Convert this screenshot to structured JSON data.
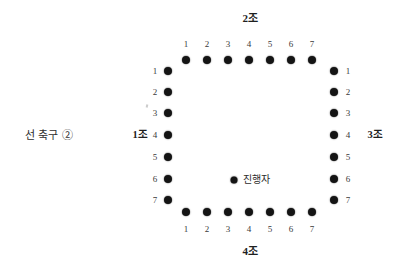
{
  "caption": {
    "text": "선 축구 ②"
  },
  "groups": {
    "top": {
      "label": "2조",
      "seats": [
        "1",
        "2",
        "3",
        "4",
        "5",
        "6",
        "7"
      ]
    },
    "right": {
      "label": "3조",
      "seats": [
        "1",
        "2",
        "3",
        "4",
        "5",
        "6",
        "7"
      ]
    },
    "bottom": {
      "label": "4조",
      "seats": [
        "1",
        "2",
        "3",
        "4",
        "5",
        "6",
        "7"
      ]
    },
    "left": {
      "label": "1조",
      "seats": [
        "1",
        "2",
        "3",
        "4",
        "5",
        "6",
        "7"
      ]
    }
  },
  "facilitator": {
    "label": "진행자"
  },
  "colors": {
    "dot": "#141414",
    "background": "#ffffff",
    "text": "#2b2b2b"
  }
}
